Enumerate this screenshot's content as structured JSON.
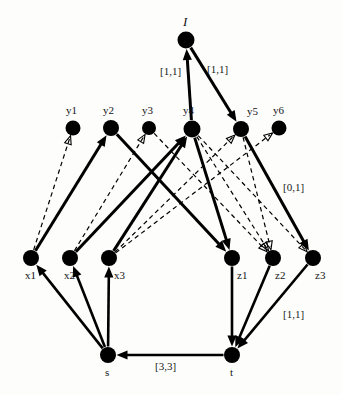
{
  "figure": {
    "kind": "network-flow-diagram",
    "background_color": "#fdfdfc",
    "node_color": "#000000",
    "edge_color": "#000000",
    "width": 342,
    "height": 395
  },
  "nodes": [
    {
      "id": "I",
      "label": "I",
      "x": 186,
      "y": 40,
      "r": 8.5,
      "label_dx": -3,
      "label_dy": -26,
      "style": "italic"
    },
    {
      "id": "y1",
      "label": "y1",
      "x": 73,
      "y": 128,
      "r": 7.5,
      "label_dx": -7,
      "label_dy": -24,
      "style": "plain"
    },
    {
      "id": "y2",
      "label": "y2",
      "x": 111,
      "y": 128,
      "r": 8.0,
      "label_dx": -8,
      "label_dy": -24,
      "style": "plain"
    },
    {
      "id": "y3",
      "label": "y3",
      "x": 149,
      "y": 128,
      "r": 7.0,
      "label_dx": -7,
      "label_dy": -24,
      "style": "plain"
    },
    {
      "id": "y4",
      "label": "y4",
      "x": 192,
      "y": 129,
      "r": 8.5,
      "label_dx": -9,
      "label_dy": -25,
      "style": "plain"
    },
    {
      "id": "y5",
      "label": "y5",
      "x": 241,
      "y": 129,
      "r": 8.0,
      "label_dx": 6,
      "label_dy": -24,
      "style": "plain"
    },
    {
      "id": "y6",
      "label": "y6",
      "x": 279,
      "y": 128,
      "r": 7.5,
      "label_dx": -6,
      "label_dy": -24,
      "style": "plain"
    },
    {
      "id": "x1",
      "label": "x1",
      "x": 31,
      "y": 258,
      "r": 8.0,
      "label_dx": -6,
      "label_dy": 11,
      "style": "plain"
    },
    {
      "id": "x2",
      "label": "x2",
      "x": 70,
      "y": 258,
      "r": 8.0,
      "label_dx": -6,
      "label_dy": 11,
      "style": "plain"
    },
    {
      "id": "x3",
      "label": "x3",
      "x": 109,
      "y": 258,
      "r": 8.0,
      "label_dx": 5,
      "label_dy": 11,
      "style": "plain"
    },
    {
      "id": "z1",
      "label": "z1",
      "x": 232,
      "y": 258,
      "r": 8.0,
      "label_dx": 5,
      "label_dy": 11,
      "style": "plain"
    },
    {
      "id": "z2",
      "label": "z2",
      "x": 273,
      "y": 258,
      "r": 8.0,
      "label_dx": 2,
      "label_dy": 11,
      "style": "plain"
    },
    {
      "id": "z3",
      "label": "z3",
      "x": 313,
      "y": 258,
      "r": 8.0,
      "label_dx": 2,
      "label_dy": 11,
      "style": "plain"
    },
    {
      "id": "s",
      "label": "s",
      "x": 108,
      "y": 355,
      "r": 8.0,
      "label_dx": -3,
      "label_dy": 11,
      "style": "plain"
    },
    {
      "id": "t",
      "label": "t",
      "x": 232,
      "y": 355,
      "r": 8.0,
      "label_dx": -2,
      "label_dy": 11,
      "style": "plain"
    }
  ],
  "edges": [
    {
      "from": "y4",
      "to": "I",
      "style": "solid",
      "width": 3.0
    },
    {
      "from": "I",
      "to": "y5",
      "style": "solid",
      "width": 3.0
    },
    {
      "from": "x1",
      "to": "y1",
      "style": "dashed",
      "width": 1.2
    },
    {
      "from": "x1",
      "to": "y2",
      "style": "solid",
      "width": 3.0
    },
    {
      "from": "x2",
      "to": "y3",
      "style": "dashed",
      "width": 1.2
    },
    {
      "from": "x2",
      "to": "y4",
      "style": "solid",
      "width": 3.0
    },
    {
      "from": "x3",
      "to": "y4",
      "style": "solid",
      "width": 3.0
    },
    {
      "from": "x3",
      "to": "y5",
      "style": "dashed",
      "width": 1.2
    },
    {
      "from": "x3",
      "to": "y6",
      "style": "dashed",
      "width": 1.2
    },
    {
      "from": "y2",
      "to": "z1",
      "style": "solid",
      "width": 3.0
    },
    {
      "from": "y4",
      "to": "z1",
      "style": "solid",
      "width": 3.0
    },
    {
      "from": "y4",
      "to": "z2",
      "style": "dashed",
      "width": 1.2
    },
    {
      "from": "y4",
      "to": "z3",
      "style": "dashed",
      "width": 1.2
    },
    {
      "from": "y5",
      "to": "z3",
      "style": "solid",
      "width": 3.0
    },
    {
      "from": "y5",
      "to": "z2",
      "style": "dashed",
      "width": 1.2
    },
    {
      "from": "y3",
      "to": "z2",
      "style": "dashed",
      "width": 1.2
    },
    {
      "from": "s",
      "to": "x1",
      "style": "solid",
      "width": 2.6
    },
    {
      "from": "s",
      "to": "x2",
      "style": "solid",
      "width": 2.6
    },
    {
      "from": "s",
      "to": "x3",
      "style": "solid",
      "width": 2.6
    },
    {
      "from": "z1",
      "to": "t",
      "style": "solid",
      "width": 2.6
    },
    {
      "from": "z2",
      "to": "t",
      "style": "solid",
      "width": 2.6
    },
    {
      "from": "z3",
      "to": "t",
      "style": "solid",
      "width": 2.6
    },
    {
      "from": "t",
      "to": "s",
      "style": "solid",
      "width": 2.6
    }
  ],
  "edge_labels": [
    {
      "id": "label-y4-I",
      "text": "[1,1]",
      "x": 160,
      "y": 65
    },
    {
      "id": "label-I-y5",
      "text": "[1,1]",
      "x": 207,
      "y": 63
    },
    {
      "id": "label-y5-z3",
      "text": "[0,1]",
      "x": 283,
      "y": 181
    },
    {
      "id": "label-z3-t",
      "text": "[1,1]",
      "x": 283,
      "y": 308
    },
    {
      "id": "label-t-s",
      "text": "[3,3]",
      "x": 155,
      "y": 360
    }
  ]
}
